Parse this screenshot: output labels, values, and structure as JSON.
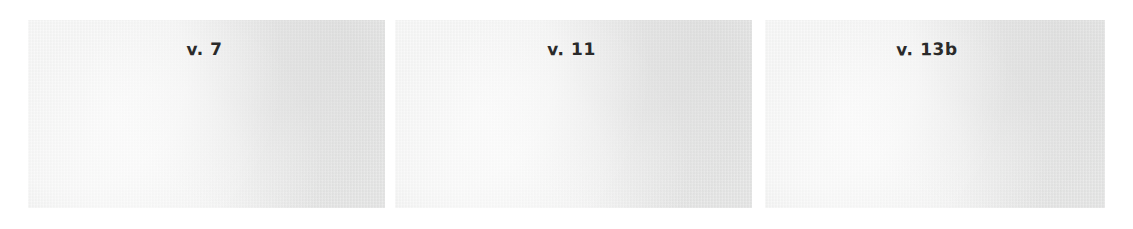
{
  "figure": {
    "background_color": "#ffffff",
    "panel_fill_color": "#e8e9e8",
    "ink_color": "#2a2a2a",
    "panels": [
      {
        "label": "v. 7",
        "name": "panel-verse-7"
      },
      {
        "label": "v. 11",
        "name": "panel-verse-11"
      },
      {
        "label": "v. 13b",
        "name": "panel-verse-13b"
      }
    ]
  }
}
